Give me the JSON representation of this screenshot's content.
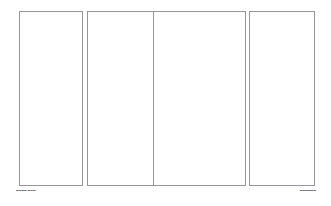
{
  "document": {
    "background_color": "#ffffff",
    "border_color": "#969699",
    "caption_color": "#5c5c60",
    "page_width": 331,
    "page_height": 206
  },
  "spreads": [
    {
      "name": "left-spread",
      "panels": [
        {
          "label": ""
        },
        {
          "label": ""
        }
      ]
    },
    {
      "name": "right-spread",
      "panels": [
        {
          "label": ""
        },
        {
          "label": ""
        }
      ]
    }
  ],
  "footer": {
    "left_caption": "▬▬▬▬ ▬▬▬",
    "right_caption": "▬▬▬▬▬▬"
  }
}
